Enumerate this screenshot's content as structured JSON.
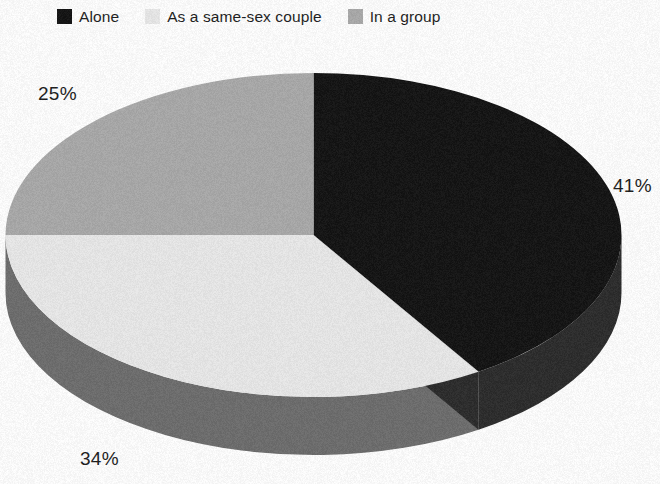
{
  "legend": {
    "items": [
      {
        "label": "Alone",
        "color": "#111111",
        "icon": "square-swatch-icon"
      },
      {
        "label": "As a same-sex couple",
        "color": "#e9e9e9",
        "icon": "square-swatch-icon"
      },
      {
        "label": "In a group",
        "color": "#a9a9a9",
        "icon": "square-swatch-icon"
      }
    ]
  },
  "labels": {
    "alone": "41%",
    "couple": "34%",
    "group": "25%"
  },
  "chart_data": {
    "type": "pie",
    "title": "",
    "subtitle": "",
    "xlabel": "",
    "ylabel": "",
    "legend_position": "top",
    "grid": false,
    "three_d": true,
    "start_angle_deg": 0,
    "direction": "clockwise",
    "categories": [
      "Alone",
      "As a same-sex couple",
      "In a group"
    ],
    "values": [
      41,
      34,
      25
    ],
    "value_labels": [
      "41%",
      "34%",
      "25%"
    ],
    "units": "percent",
    "total": 100,
    "colors": [
      "#111111",
      "#e9e9e9",
      "#a9a9a9"
    ],
    "side_colors": [
      "#2a2a2a",
      "#6c6c6c",
      "#8d8d8d"
    ],
    "slices": [
      {
        "name": "Alone",
        "value": 41,
        "label": "41%",
        "color": "#111111"
      },
      {
        "name": "As a same-sex couple",
        "value": 34,
        "label": "34%",
        "color": "#e9e9e9"
      },
      {
        "name": "In a group",
        "value": 25,
        "label": "25%",
        "color": "#a9a9a9"
      }
    ]
  }
}
